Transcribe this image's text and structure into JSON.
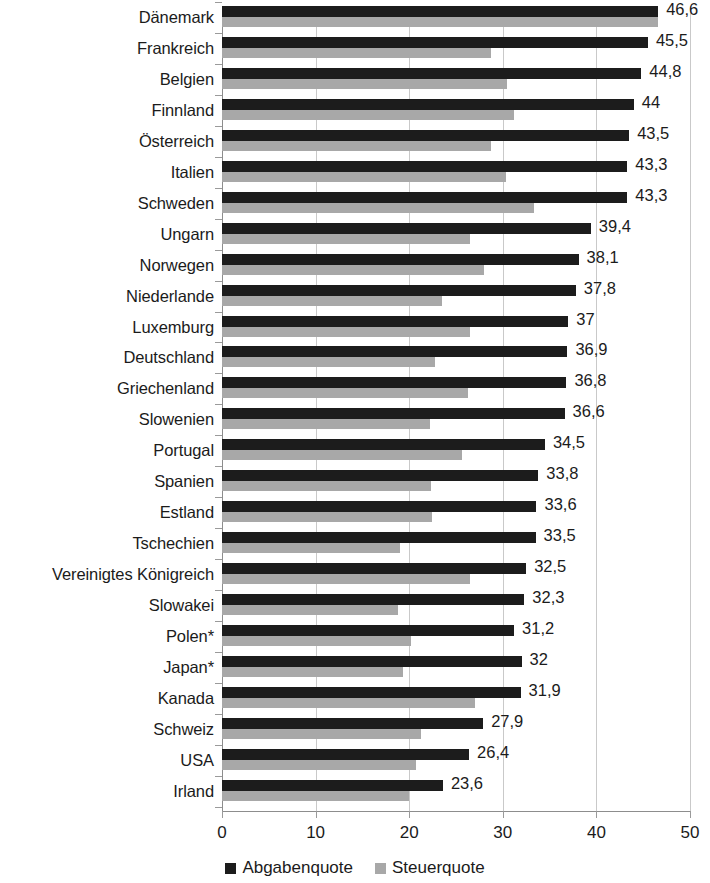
{
  "chart_data": {
    "type": "bar",
    "orientation": "horizontal",
    "title": "",
    "subtitle": "",
    "xlabel": "",
    "ylabel": "",
    "xlim": [
      0,
      50
    ],
    "xticks": [
      0,
      10,
      20,
      30,
      40,
      50
    ],
    "xtick_labels": [
      "0",
      "10",
      "20",
      "30",
      "40",
      "50"
    ],
    "grid": true,
    "grid_axis": "x",
    "legend_position": "bottom",
    "categories": [
      "Dänemark",
      "Frankreich",
      "Belgien",
      "Finnland",
      "Österreich",
      "Italien",
      "Schweden",
      "Ungarn",
      "Norwegen",
      "Niederlande",
      "Luxemburg",
      "Deutschland",
      "Griechenland",
      "Slowenien",
      "Portugal",
      "Spanien",
      "Estland",
      "Tschechien",
      "Vereinigtes Königreich",
      "Slowakei",
      "Polen*",
      "Japan*",
      "Kanada",
      "Schweiz",
      "USA",
      "Irland"
    ],
    "series": [
      {
        "name": "Abgabenquote",
        "color": "#1c1c1c",
        "values": [
          46.6,
          45.5,
          44.8,
          44,
          43.5,
          43.3,
          43.3,
          39.4,
          38.1,
          37.8,
          37,
          36.9,
          36.8,
          36.6,
          34.5,
          33.8,
          33.6,
          33.5,
          32.5,
          32.3,
          31.2,
          32,
          31.9,
          27.9,
          26.4,
          23.6
        ],
        "data_labels": [
          "46,6",
          "45,5",
          "44,8",
          "44",
          "43,5",
          "43,3",
          "43,3",
          "39,4",
          "38,1",
          "37,8",
          "37",
          "36,9",
          "36,8",
          "36,6",
          "34,5",
          "33,8",
          "33,6",
          "33,5",
          "32,5",
          "32,3",
          "31,2",
          "32",
          "31,9",
          "27,9",
          "26,4",
          "23,6"
        ]
      },
      {
        "name": "Steuerquote",
        "color": "#a8a8a8",
        "values": [
          46.6,
          28.7,
          30.4,
          31.2,
          28.7,
          30.3,
          33.3,
          26.5,
          28.0,
          23.5,
          26.5,
          22.8,
          26.3,
          22.2,
          25.6,
          22.3,
          22.4,
          19.0,
          26.5,
          18.8,
          20.2,
          19.3,
          27.0,
          21.3,
          20.7,
          20.0
        ],
        "data_labels": []
      }
    ],
    "legend": [
      {
        "label": "Abgabenquote",
        "color": "#1c1c1c"
      },
      {
        "label": "Steuerquote",
        "color": "#a8a8a8"
      }
    ]
  }
}
